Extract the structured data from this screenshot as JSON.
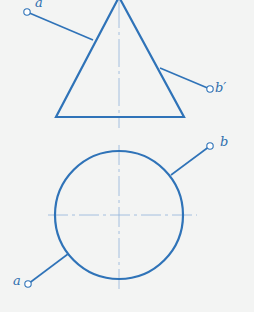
{
  "colors": {
    "stroke": "#2f73b8",
    "centerline": "#8fb3d9",
    "background": "#f3f4f3",
    "label": "#2f6fae"
  },
  "front_view": {
    "shape": "triangle",
    "apex": [
      119,
      -3
    ],
    "base_left": [
      56,
      117
    ],
    "base_right": [
      184,
      117
    ],
    "centerline_x": 119,
    "centerline_y_range": [
      0,
      128
    ],
    "line_a_prime": {
      "from": [
        27,
        12
      ],
      "to": [
        93,
        40
      ]
    },
    "line_b_prime": {
      "from": [
        160,
        68
      ],
      "to": [
        210,
        89
      ]
    }
  },
  "top_view": {
    "shape": "circle",
    "center": [
      119,
      215
    ],
    "radius": 64,
    "h_centerline_x_range": [
      48,
      197
    ],
    "v_centerline_y_range": [
      145,
      290
    ],
    "line_a": {
      "from": [
        28,
        284
      ],
      "to": [
        68,
        254
      ]
    },
    "line_b": {
      "from": [
        171,
        175
      ],
      "to": [
        210,
        146
      ]
    }
  },
  "labels": {
    "a_prime": "a′",
    "b_prime": "b′",
    "a": "a",
    "b": "b"
  }
}
